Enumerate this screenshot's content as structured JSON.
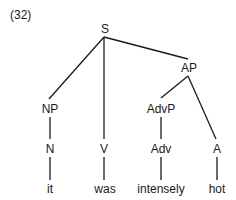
{
  "example_number": "(32)",
  "tree": {
    "nodes": {
      "S": {
        "label": "S",
        "x": 105,
        "y": 22
      },
      "AP": {
        "label": "AP",
        "x": 189,
        "y": 61
      },
      "NP": {
        "label": "NP",
        "x": 50,
        "y": 102
      },
      "V": {
        "label": "V",
        "x": 104,
        "y": 142
      },
      "AdvP": {
        "label": "AdvP",
        "x": 161,
        "y": 102
      },
      "N": {
        "label": "N",
        "x": 50,
        "y": 142
      },
      "Adv": {
        "label": "Adv",
        "x": 161,
        "y": 142
      },
      "A": {
        "label": "A",
        "x": 217,
        "y": 142
      },
      "it": {
        "label": "it",
        "x": 50,
        "y": 182
      },
      "was": {
        "label": "was",
        "x": 105,
        "y": 182
      },
      "intensely": {
        "label": "intensely",
        "x": 161,
        "y": 182
      },
      "hot": {
        "label": "hot",
        "x": 217,
        "y": 182
      }
    },
    "edges": [
      [
        "S",
        "NP"
      ],
      [
        "S",
        "V"
      ],
      [
        "S",
        "AP"
      ],
      [
        "AP",
        "AdvP"
      ],
      [
        "AP",
        "A"
      ],
      [
        "NP",
        "N"
      ],
      [
        "AdvP",
        "Adv"
      ],
      [
        "N",
        "it"
      ],
      [
        "V",
        "was"
      ],
      [
        "Adv",
        "intensely"
      ],
      [
        "A",
        "hot"
      ]
    ]
  }
}
